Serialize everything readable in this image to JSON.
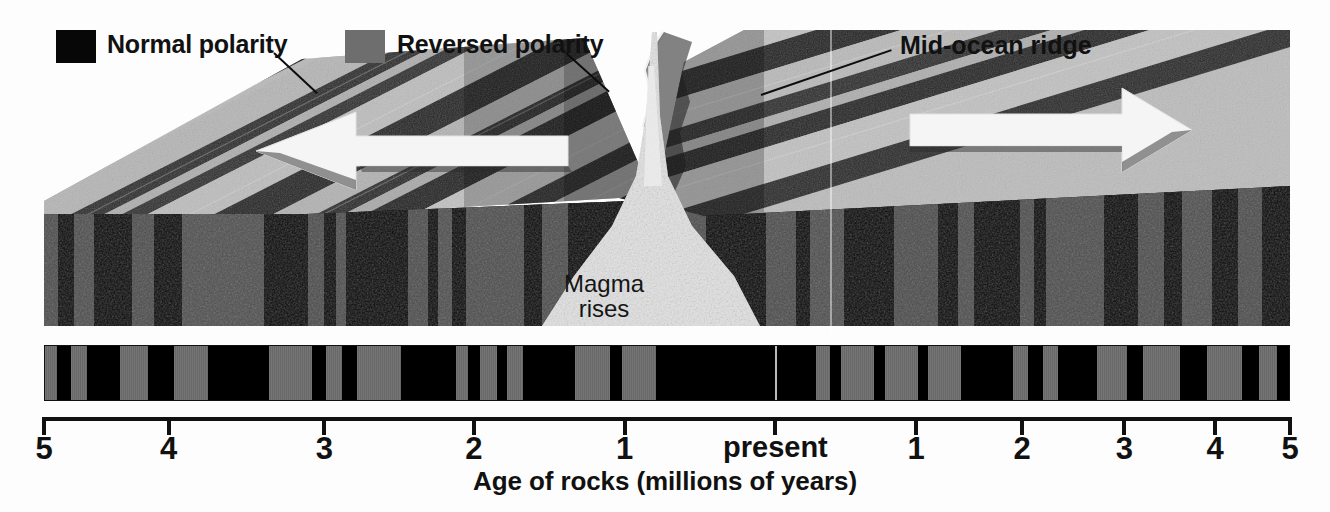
{
  "figure": {
    "caption": "Age of rocks (millions of years)",
    "colors": {
      "normal_polarity": "#000000",
      "reversed_polarity": "#6e6e6e",
      "background": "#ffffff",
      "arrow": "#f4f4f4",
      "magma": "#d8d8d8",
      "text": "#111111"
    }
  },
  "legend": {
    "items": [
      {
        "label": "Normal polarity",
        "swatch": "#070707",
        "swatch_name": "normal-polarity-swatch"
      },
      {
        "label": "Reversed polarity",
        "swatch": "#6e6e6e",
        "swatch_name": "reversed-polarity-swatch"
      }
    ]
  },
  "callouts": {
    "ridge": "Mid-ocean ridge",
    "magma_line1": "Magma",
    "magma_line2": "rises"
  },
  "axis": {
    "label": "Age of rocks (millions of years)",
    "present_label": "present",
    "ticks": [
      {
        "value": 5,
        "label": "5",
        "side": "left",
        "pos_pct": 0.0
      },
      {
        "value": 4,
        "label": "4",
        "side": "left",
        "pos_pct": 10.0
      },
      {
        "value": 3,
        "label": "3",
        "side": "left",
        "pos_pct": 22.5
      },
      {
        "value": 2,
        "label": "2",
        "side": "left",
        "pos_pct": 34.5
      },
      {
        "value": 1,
        "label": "1",
        "side": "left",
        "pos_pct": 46.6
      },
      {
        "value": 0,
        "label": "present",
        "side": "center",
        "pos_pct": 58.7
      },
      {
        "value": 1,
        "label": "1",
        "side": "right",
        "pos_pct": 70.0
      },
      {
        "value": 2,
        "label": "2",
        "side": "right",
        "pos_pct": 78.5
      },
      {
        "value": 3,
        "label": "3",
        "side": "right",
        "pos_pct": 86.7
      },
      {
        "value": 4,
        "label": "4",
        "side": "right",
        "pos_pct": 94.0
      },
      {
        "value": 5,
        "label": "5",
        "side": "right",
        "pos_pct": 100.0
      }
    ]
  },
  "chart_data": {
    "type": "bar",
    "xlabel": "Age of rocks (millions of years)",
    "ylabel": "",
    "grid": false,
    "legend_position": "top",
    "xlim": [
      -5,
      5
    ],
    "x_tick_labels": [
      "5",
      "4",
      "3",
      "2",
      "1",
      "present",
      "1",
      "2",
      "3",
      "4",
      "5"
    ],
    "categories": [
      "Normal polarity",
      "Reversed polarity"
    ],
    "annotations": [
      "Mid-ocean ridge",
      "Magma rises"
    ],
    "stripes": [
      {
        "start": 0.0,
        "end": 1.0,
        "polarity": "reversed"
      },
      {
        "start": 1.0,
        "end": 2.1,
        "polarity": "normal"
      },
      {
        "start": 2.1,
        "end": 3.4,
        "polarity": "reversed"
      },
      {
        "start": 3.4,
        "end": 6.0,
        "polarity": "normal"
      },
      {
        "start": 6.0,
        "end": 8.3,
        "polarity": "reversed"
      },
      {
        "start": 8.3,
        "end": 10.4,
        "polarity": "normal"
      },
      {
        "start": 10.4,
        "end": 13.1,
        "polarity": "reversed"
      },
      {
        "start": 13.1,
        "end": 18.0,
        "polarity": "normal"
      },
      {
        "start": 18.0,
        "end": 21.5,
        "polarity": "reversed"
      },
      {
        "start": 21.5,
        "end": 22.6,
        "polarity": "normal"
      },
      {
        "start": 22.6,
        "end": 23.9,
        "polarity": "reversed"
      },
      {
        "start": 23.9,
        "end": 25.1,
        "polarity": "normal"
      },
      {
        "start": 25.1,
        "end": 28.6,
        "polarity": "reversed"
      },
      {
        "start": 28.6,
        "end": 33.0,
        "polarity": "normal"
      },
      {
        "start": 33.0,
        "end": 34.0,
        "polarity": "reversed"
      },
      {
        "start": 34.0,
        "end": 35.0,
        "polarity": "normal"
      },
      {
        "start": 35.0,
        "end": 36.3,
        "polarity": "reversed"
      },
      {
        "start": 36.3,
        "end": 37.1,
        "polarity": "normal"
      },
      {
        "start": 37.1,
        "end": 38.4,
        "polarity": "reversed"
      },
      {
        "start": 38.4,
        "end": 42.6,
        "polarity": "normal"
      },
      {
        "start": 42.6,
        "end": 45.4,
        "polarity": "reversed"
      },
      {
        "start": 45.4,
        "end": 46.4,
        "polarity": "normal"
      },
      {
        "start": 46.4,
        "end": 49.1,
        "polarity": "reversed"
      },
      {
        "start": 49.1,
        "end": 58.7,
        "polarity": "normal"
      },
      {
        "start": 58.7,
        "end": 62.0,
        "polarity": "normal"
      },
      {
        "start": 62.0,
        "end": 63.1,
        "polarity": "reversed"
      },
      {
        "start": 63.1,
        "end": 64.0,
        "polarity": "normal"
      },
      {
        "start": 64.0,
        "end": 66.6,
        "polarity": "reversed"
      },
      {
        "start": 66.6,
        "end": 67.5,
        "polarity": "normal"
      },
      {
        "start": 67.5,
        "end": 70.2,
        "polarity": "reversed"
      },
      {
        "start": 70.2,
        "end": 71.0,
        "polarity": "normal"
      },
      {
        "start": 71.0,
        "end": 73.6,
        "polarity": "reversed"
      },
      {
        "start": 73.6,
        "end": 77.8,
        "polarity": "normal"
      },
      {
        "start": 77.8,
        "end": 79.0,
        "polarity": "reversed"
      },
      {
        "start": 79.0,
        "end": 80.2,
        "polarity": "normal"
      },
      {
        "start": 80.2,
        "end": 81.4,
        "polarity": "reversed"
      },
      {
        "start": 81.4,
        "end": 84.6,
        "polarity": "normal"
      },
      {
        "start": 84.6,
        "end": 87.0,
        "polarity": "reversed"
      },
      {
        "start": 87.0,
        "end": 88.3,
        "polarity": "normal"
      },
      {
        "start": 88.3,
        "end": 91.2,
        "polarity": "reversed"
      },
      {
        "start": 91.2,
        "end": 93.4,
        "polarity": "normal"
      },
      {
        "start": 93.4,
        "end": 96.2,
        "polarity": "reversed"
      },
      {
        "start": 96.2,
        "end": 97.6,
        "polarity": "normal"
      },
      {
        "start": 97.6,
        "end": 99.0,
        "polarity": "reversed"
      },
      {
        "start": 99.0,
        "end": 100.0,
        "polarity": "normal"
      }
    ]
  }
}
